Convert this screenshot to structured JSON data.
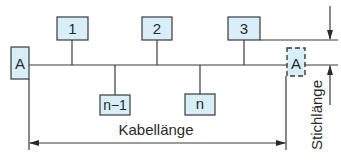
{
  "diagram": {
    "type": "cable-bus-topology",
    "nodes_top": [
      {
        "id": "1",
        "label": "1"
      },
      {
        "id": "2",
        "label": "2"
      },
      {
        "id": "3",
        "label": "3"
      }
    ],
    "nodes_bottom": [
      {
        "id": "n-1",
        "label": "n−1"
      },
      {
        "id": "n",
        "label": "n"
      }
    ],
    "terminator_left": {
      "label": "A",
      "style": "solid"
    },
    "terminator_right": {
      "label": "A",
      "style": "dashed"
    },
    "dimensions": {
      "cable_length_label": "Kabellänge",
      "stub_length_label": "Stichlänge"
    },
    "colors": {
      "box_fill": "#d8eef8",
      "line": "#3a3a3a"
    }
  }
}
